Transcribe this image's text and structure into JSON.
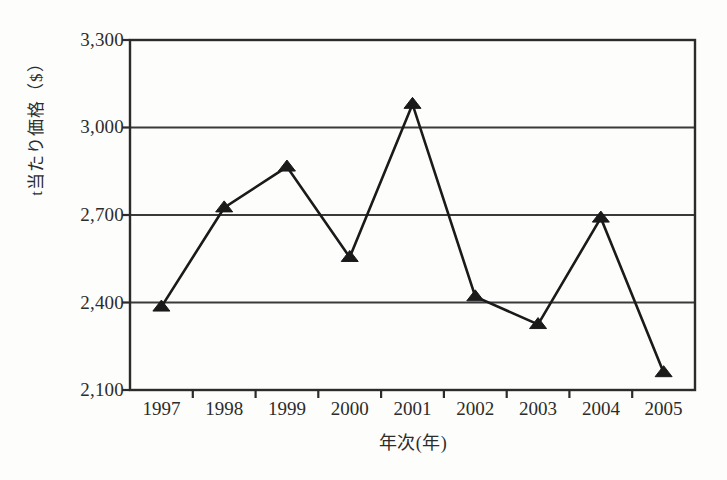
{
  "chart_data": {
    "type": "line",
    "title": "",
    "xlabel": "年次(年)",
    "ylabel": "t当たり価格（$）",
    "categories": [
      "1997",
      "1998",
      "1999",
      "2000",
      "2001",
      "2002",
      "2003",
      "2004",
      "2005"
    ],
    "values": [
      2385,
      2725,
      2865,
      2555,
      3080,
      2420,
      2325,
      2690,
      2160
    ],
    "series": [
      {
        "name": "t当たり価格（$）",
        "values": [
          2385,
          2725,
          2865,
          2555,
          3080,
          2420,
          2325,
          2690,
          2160
        ],
        "marker": "filled-triangle",
        "color": "#1a1a1a"
      }
    ],
    "ylim": [
      2100,
      3300
    ],
    "y_ticks": [
      2100,
      2400,
      2700,
      3000,
      3300
    ],
    "y_tick_labels": [
      "2,100",
      "2,400",
      "2,700",
      "3,000",
      "3,300"
    ],
    "grid": true,
    "grid_axis": "y",
    "legend": "none",
    "colors": {
      "line": "#1a1a1a",
      "marker": "#111111",
      "frame": "#2b2b2b",
      "gridline": "#3a3a3a",
      "background": "#fdfdfb",
      "text": "#2c2c2c"
    }
  }
}
